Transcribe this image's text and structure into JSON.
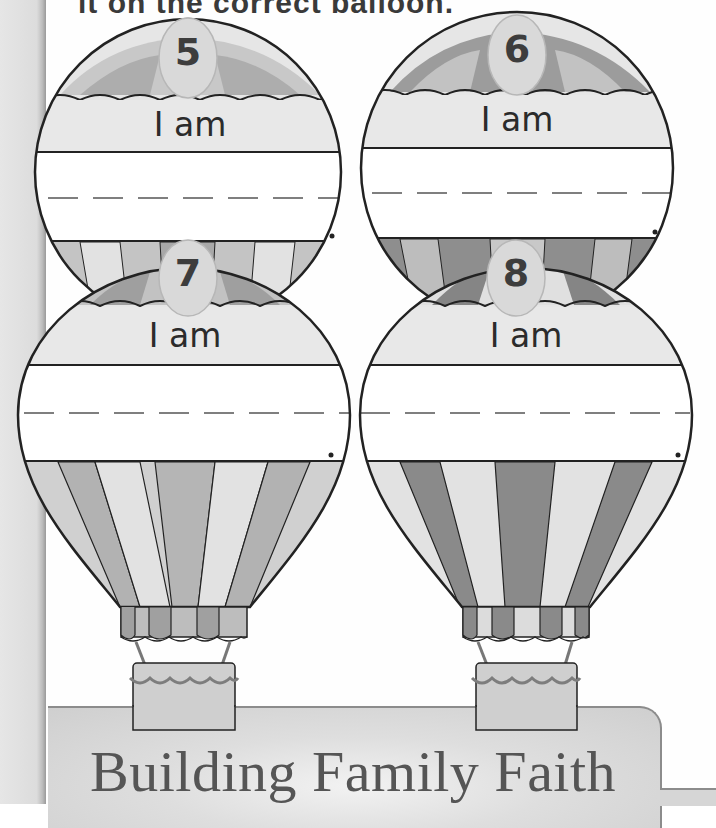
{
  "page": {
    "instruction_partial": "it on the correct balloon.",
    "colors": {
      "side_strip": "#dcdcdc",
      "balloon_light": "#e4e4e4",
      "balloon_mid": "#bdbdbd",
      "balloon_dark": "#8f8f8f",
      "outline": "#222222",
      "badge_fill": "#dadada",
      "number_color": "#3d3d3d",
      "banner_fill": "#d9d9d9",
      "banner_text": "#555555"
    }
  },
  "balloons": [
    {
      "number": "5",
      "label": "I am",
      "answer": "",
      "end_mark": "."
    },
    {
      "number": "6",
      "label": "I am",
      "answer": "",
      "end_mark": "."
    },
    {
      "number": "7",
      "label": "I am",
      "answer": "",
      "end_mark": "."
    },
    {
      "number": "8",
      "label": "I am",
      "answer": "",
      "end_mark": "."
    }
  ],
  "banner": {
    "title": "Building Family Faith"
  }
}
